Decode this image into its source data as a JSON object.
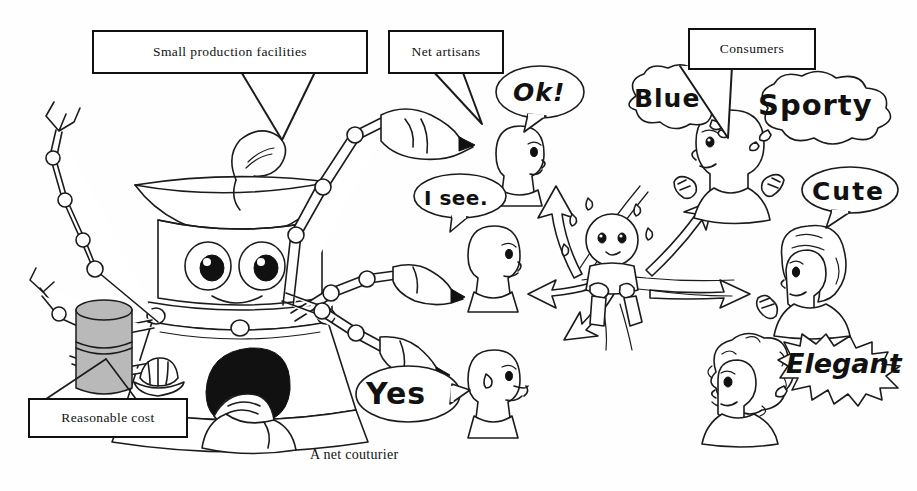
{
  "figure": {
    "caption": "A net couturier",
    "background_color": "#fefefe",
    "ink_color": "#1b1b1b"
  },
  "callouts": [
    {
      "id": "small-production-facilities",
      "label": "Small production facilities"
    },
    {
      "id": "net-artisans",
      "label": "Net artisans"
    },
    {
      "id": "consumers",
      "label": "Consumers"
    },
    {
      "id": "reasonable-cost",
      "label": "Reasonable cost"
    }
  ],
  "speech_bubbles": [
    {
      "id": "ok",
      "text": "Ok!",
      "speaker": "net-artisan-upper",
      "style": "oval"
    },
    {
      "id": "i-see",
      "text": "I see.",
      "speaker": "net-artisan-middle",
      "style": "oval"
    },
    {
      "id": "yes",
      "text": "Yes",
      "speaker": "net-artisan-lower",
      "style": "oval"
    },
    {
      "id": "blue",
      "text": "Blue",
      "speaker": "consumer-upper",
      "style": "cloud"
    },
    {
      "id": "sporty",
      "text": "Sporty",
      "speaker": "consumer-upper",
      "style": "cloud"
    },
    {
      "id": "cute",
      "text": "Cute",
      "speaker": "consumer-middle",
      "style": "oval"
    },
    {
      "id": "elegant",
      "text": "Elegant",
      "speaker": "consumer-lower",
      "style": "cloud-spiky"
    }
  ],
  "characters": [
    {
      "id": "robot-couturier",
      "description": "multi-armed robot with bowl hat and pen-nib hands"
    },
    {
      "id": "seated-worker",
      "description": "dark-haired worker seated at the robot base"
    },
    {
      "id": "money-cylinder",
      "description": "gray cylinder representing cost",
      "fill": "#b9b9b9"
    },
    {
      "id": "net-artisan-upper",
      "description": "bald head profile"
    },
    {
      "id": "net-artisan-middle",
      "description": "bald head profile"
    },
    {
      "id": "net-artisan-lower",
      "description": "bald head profile with sweat drop"
    },
    {
      "id": "network-figure",
      "description": "small figure tangled in network strands with radiating arrows"
    },
    {
      "id": "consumer-upper",
      "description": "consumer with raised fists"
    },
    {
      "id": "consumer-middle",
      "description": "consumer with wavy hair giving thumbs up"
    },
    {
      "id": "consumer-lower",
      "description": "consumer with curly hair"
    }
  ]
}
